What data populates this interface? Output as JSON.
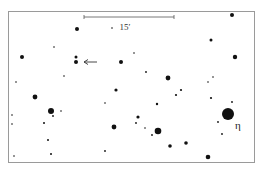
{
  "chart_data": {
    "type": "scatter",
    "title": "",
    "frame": {
      "x": 8,
      "y": 11,
      "width": 246,
      "height": 151
    },
    "scale_bar": {
      "x1": 84,
      "x2": 174,
      "y": 17,
      "label": "15′",
      "label_x": 125,
      "label_y": 30
    },
    "labels": [
      {
        "text": "η",
        "x": 235,
        "y": 129
      }
    ],
    "arrow": {
      "from": [
        97,
        62
      ],
      "to": [
        84,
        62
      ]
    },
    "stars": [
      {
        "x": 232,
        "y": 15,
        "r": 2.0
      },
      {
        "x": 77,
        "y": 29,
        "r": 2.0
      },
      {
        "x": 112,
        "y": 28,
        "r": 0.8
      },
      {
        "x": 54,
        "y": 47,
        "r": 0.8
      },
      {
        "x": 22,
        "y": 57,
        "r": 2.0
      },
      {
        "x": 76,
        "y": 57,
        "r": 1.5
      },
      {
        "x": 76,
        "y": 62,
        "r": 2.0
      },
      {
        "x": 121,
        "y": 62,
        "r": 2.0
      },
      {
        "x": 134,
        "y": 53,
        "r": 0.8
      },
      {
        "x": 211,
        "y": 40,
        "r": 1.5
      },
      {
        "x": 235,
        "y": 57,
        "r": 2.2
      },
      {
        "x": 146,
        "y": 72,
        "r": 0.9
      },
      {
        "x": 64,
        "y": 76,
        "r": 0.8
      },
      {
        "x": 168,
        "y": 78,
        "r": 2.4
      },
      {
        "x": 213,
        "y": 77,
        "r": 0.8
      },
      {
        "x": 208,
        "y": 82,
        "r": 0.8
      },
      {
        "x": 16,
        "y": 82,
        "r": 0.8
      },
      {
        "x": 35,
        "y": 97,
        "r": 2.4
      },
      {
        "x": 116,
        "y": 90,
        "r": 1.6
      },
      {
        "x": 181,
        "y": 90,
        "r": 1.1
      },
      {
        "x": 176,
        "y": 95,
        "r": 1.1
      },
      {
        "x": 211,
        "y": 98,
        "r": 1.1
      },
      {
        "x": 232,
        "y": 102,
        "r": 0.9
      },
      {
        "x": 105,
        "y": 103,
        "r": 0.8
      },
      {
        "x": 157,
        "y": 104,
        "r": 1.2
      },
      {
        "x": 51,
        "y": 111,
        "r": 3.0
      },
      {
        "x": 61,
        "y": 111,
        "r": 0.8
      },
      {
        "x": 53,
        "y": 116,
        "r": 0.9
      },
      {
        "x": 12,
        "y": 115,
        "r": 0.8
      },
      {
        "x": 12,
        "y": 124,
        "r": 0.8
      },
      {
        "x": 44,
        "y": 123,
        "r": 1.0
      },
      {
        "x": 138,
        "y": 117,
        "r": 1.6
      },
      {
        "x": 228,
        "y": 114,
        "r": 6.0
      },
      {
        "x": 218,
        "y": 122,
        "r": 0.9
      },
      {
        "x": 114,
        "y": 127,
        "r": 2.4
      },
      {
        "x": 136,
        "y": 123,
        "r": 0.9
      },
      {
        "x": 145,
        "y": 128,
        "r": 0.8
      },
      {
        "x": 158,
        "y": 131,
        "r": 3.3
      },
      {
        "x": 152,
        "y": 135,
        "r": 0.9
      },
      {
        "x": 222,
        "y": 134,
        "r": 0.9
      },
      {
        "x": 48,
        "y": 140,
        "r": 1.0
      },
      {
        "x": 170,
        "y": 146,
        "r": 1.8
      },
      {
        "x": 186,
        "y": 143,
        "r": 1.8
      },
      {
        "x": 105,
        "y": 151,
        "r": 0.9
      },
      {
        "x": 14,
        "y": 156,
        "r": 0.8
      },
      {
        "x": 51,
        "y": 154,
        "r": 1.0
      },
      {
        "x": 208,
        "y": 157,
        "r": 2.3
      }
    ]
  }
}
